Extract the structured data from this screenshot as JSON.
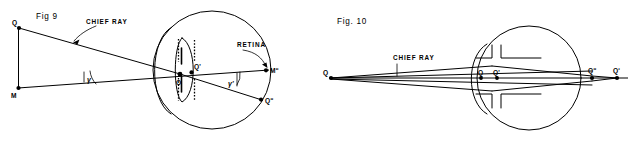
{
  "sheet": {
    "width": 634,
    "height": 161,
    "background_color": "#ffffff",
    "ink_color": "#000000"
  },
  "figures": [
    {
      "id": "fig9",
      "title": "Fig 9",
      "description": "Schematic eye with off-axis object point; chief ray from Q through nodal region to retinal image point Q double prime.",
      "callouts": [
        {
          "name": "chief-ray",
          "text": "CHIEF RAY"
        },
        {
          "name": "retina",
          "text": "RETINA"
        }
      ],
      "points": [
        {
          "name": "object-point-q",
          "label": "Q"
        },
        {
          "name": "axial-object-point-m",
          "label": "M"
        },
        {
          "name": "entrance-pupil-center-o",
          "label": "O"
        },
        {
          "name": "exit-pupil-center-q-prime",
          "label": "Q'"
        },
        {
          "name": "retinal-axial-point-m-double-prime",
          "label": "Mʺ"
        },
        {
          "name": "retinal-image-point-q-double-prime",
          "label": "Qʺ"
        }
      ],
      "angles": [
        {
          "name": "object-field-angle",
          "label": "γ"
        },
        {
          "name": "image-field-angle",
          "label": "γ'"
        }
      ]
    },
    {
      "id": "fig10",
      "title": "Fig. 10",
      "description": "On-axis schematic eye with cross shaped iris aperture; marginal rays from axial object point Q converge to axial image points.",
      "callouts": [
        {
          "name": "chief-ray",
          "text": "CHIEF RAY"
        }
      ],
      "points": [
        {
          "name": "axial-object-point-q",
          "label": "Q"
        },
        {
          "name": "entrance-pupil-center-q",
          "label": "Q"
        },
        {
          "name": "exit-pupil-center-q-prime",
          "label": "Q'"
        },
        {
          "name": "retinal-image-point-q-double-prime",
          "label": "Qʺ"
        },
        {
          "name": "far-axial-point-q-triple-prime",
          "label": "Qʹ"
        }
      ]
    }
  ]
}
